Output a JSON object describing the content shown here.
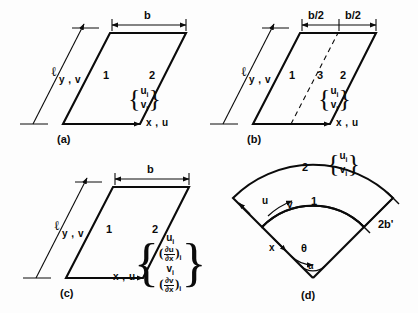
{
  "figure": {
    "ink_color": "#0b0b0b",
    "background": "#fdfdfd"
  },
  "panels": [
    {
      "id": "a",
      "caption": "(a)",
      "nodes": [
        "1",
        "2"
      ],
      "dimension_label": "b",
      "length_symbol": "ℓ",
      "axis_x": "x , u",
      "axis_y": "y , v",
      "dof": {
        "open_brace": "{",
        "close_brace": "}",
        "rows": [
          "u",
          "v"
        ],
        "subscript": "i"
      }
    },
    {
      "id": "b",
      "caption": "(b)",
      "nodes": [
        "1",
        "3",
        "2"
      ],
      "dimension_labels": [
        "b/2",
        "b/2"
      ],
      "length_symbol": "ℓ",
      "axis_x": "x , u",
      "axis_y": "y , v",
      "dof": {
        "open_brace": "{",
        "close_brace": "}",
        "rows": [
          "u",
          "v"
        ],
        "subscript": "i"
      }
    },
    {
      "id": "c",
      "caption": "(c)",
      "nodes": [
        "1",
        "2"
      ],
      "dimension_label": "b",
      "length_symbol": "ℓ",
      "axis_x": "x , u",
      "axis_y": "y , v",
      "dof": {
        "open_brace": "{",
        "close_brace": "}",
        "subscript": "i",
        "rows": [
          {
            "kind": "plain",
            "symbol": "u"
          },
          {
            "kind": "derivative",
            "numerator": "∂u",
            "denominator": "∂x"
          },
          {
            "kind": "plain",
            "symbol": "v"
          },
          {
            "kind": "derivative",
            "numerator": "∂v",
            "denominator": "∂x"
          }
        ]
      }
    },
    {
      "id": "d",
      "caption": "(d)",
      "nodes": [
        "1",
        "2"
      ],
      "width_label": "2b'",
      "axis_u": "u",
      "axis_v": "v",
      "axis_x": "x",
      "angle_label": "θ",
      "apex_angle_label": "α",
      "dof": {
        "open_brace": "{",
        "close_brace": "}",
        "rows": [
          "u",
          "v"
        ],
        "subscript": "i"
      }
    }
  ]
}
